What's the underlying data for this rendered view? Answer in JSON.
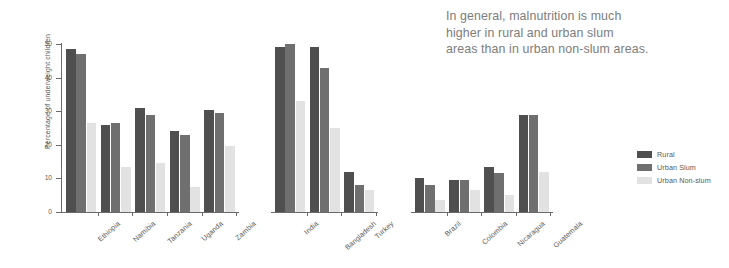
{
  "annotation": {
    "line1": "In general, malnutrition is much",
    "line2": "higher in rural and urban slum",
    "line3": "areas than in urban non-slum areas."
  },
  "legend": {
    "items": [
      {
        "label": "Rural",
        "color": "#4f4f4f"
      },
      {
        "label": "Urban Slum",
        "color": "#6f6f6f"
      },
      {
        "label": "Urban Non-slum",
        "color": "#e2e2e2"
      }
    ]
  },
  "chart_data": {
    "type": "bar",
    "title": "",
    "xlabel": "",
    "ylabel": "Percentage of underweight children",
    "ylim": [
      0,
      50
    ],
    "yticks": [
      0,
      10,
      20,
      30,
      40,
      50
    ],
    "ytick_labels": [
      "0",
      "10",
      "20",
      "30",
      "40",
      "50"
    ],
    "grid": false,
    "legend_position": "right",
    "categories": [
      "Ethiopia",
      "Namibia",
      "Tanzania",
      "Uganda",
      "Zambia",
      "India",
      "Bangladesh",
      "Turkey",
      "Brazil",
      "Colombia",
      "Nicaragua",
      "Guatemala"
    ],
    "group_breaks": [
      5,
      8
    ],
    "series": [
      {
        "name": "Rural",
        "color": "#4f4f4f",
        "values": [
          48.5,
          26,
          31,
          24,
          30.5,
          49,
          49,
          12,
          10,
          9.5,
          13.5,
          29
        ]
      },
      {
        "name": "Urban Slum",
        "color": "#6f6f6f",
        "values": [
          47,
          26.5,
          29,
          23,
          29.5,
          50,
          43,
          8,
          8,
          9.5,
          11.5,
          29
        ]
      },
      {
        "name": "Urban Non-slum",
        "color": "#e2e2e2",
        "values": [
          26.5,
          13.5,
          14.5,
          7.5,
          19.5,
          33,
          25,
          6.5,
          3.5,
          6.5,
          5,
          12
        ]
      }
    ]
  }
}
